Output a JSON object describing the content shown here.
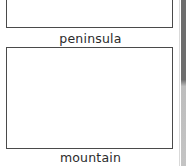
{
  "worksheet": {
    "cards": [
      {
        "label": "peninsula"
      },
      {
        "label": "mountain"
      }
    ]
  },
  "colors": {
    "border": "#4a4a4a",
    "text": "#2b2b2b",
    "page_edge": "#6e6e6e"
  }
}
